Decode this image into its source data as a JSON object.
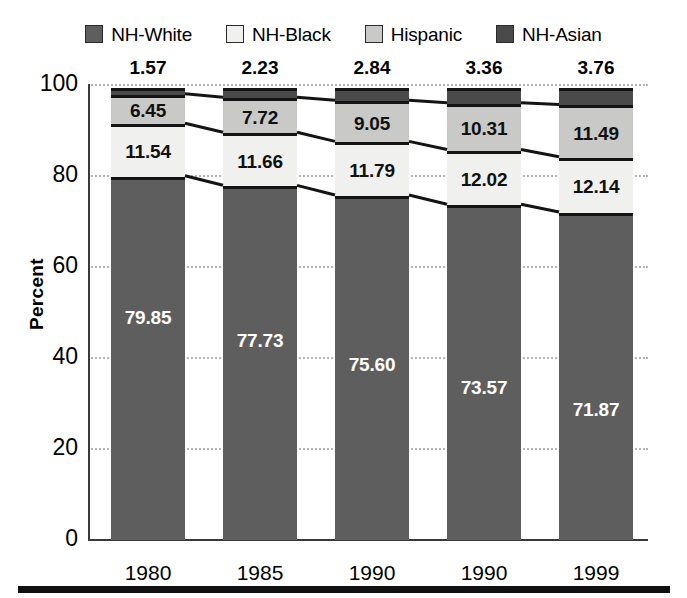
{
  "chart_data": {
    "type": "bar",
    "subtype": "stacked-100-percent",
    "title": "",
    "xlabel": "",
    "ylabel": "Percent",
    "ylim": [
      0,
      100
    ],
    "yticks": [
      "0",
      "20",
      "40",
      "60",
      "80",
      "100"
    ],
    "grid": true,
    "legend_position": "top",
    "categories": [
      "1980",
      "1985",
      "1990",
      "1990",
      "1999"
    ],
    "series": [
      {
        "name": "NH-White",
        "color": "#5e5e5e",
        "label_color": "#ffffff",
        "values": [
          79.85,
          77.73,
          75.6,
          73.57,
          71.87
        ],
        "labels": [
          "79.85",
          "77.73",
          "75.60",
          "73.57",
          "71.87"
        ]
      },
      {
        "name": "NH-Black",
        "color": "#f0f0ee",
        "label_color": "#111111",
        "values": [
          11.54,
          11.66,
          11.79,
          12.02,
          12.14
        ],
        "labels": [
          "11.54",
          "11.66",
          "11.79",
          "12.02",
          "12.14"
        ]
      },
      {
        "name": "Hispanic",
        "color": "#c9c9c7",
        "label_color": "#111111",
        "values": [
          6.45,
          7.72,
          9.05,
          10.31,
          11.49
        ],
        "labels": [
          "6.45",
          "7.72",
          "9.05",
          "10.31",
          "11.49"
        ]
      },
      {
        "name": "NH-Asian",
        "color": "#4a4a4a",
        "label_color": "#111111",
        "values": [
          1.57,
          2.23,
          2.84,
          3.36,
          3.76
        ],
        "labels": [
          "1.57",
          "2.23",
          "2.84",
          "3.36",
          "3.76"
        ],
        "labels_outside": true
      }
    ]
  },
  "legend": {
    "items": [
      {
        "label": "NH-White",
        "color": "#5e5e5e"
      },
      {
        "label": "NH-Black",
        "color": "#f0f0ee"
      },
      {
        "label": "Hispanic",
        "color": "#c9c9c7"
      },
      {
        "label": "NH-Asian",
        "color": "#4a4a4a"
      }
    ]
  },
  "axes": {
    "y_title": "Percent",
    "y_ticks": [
      "100",
      "80",
      "60",
      "40",
      "20",
      "0"
    ],
    "x_ticks": [
      "1980",
      "1985",
      "1990",
      "1990",
      "1999"
    ]
  }
}
